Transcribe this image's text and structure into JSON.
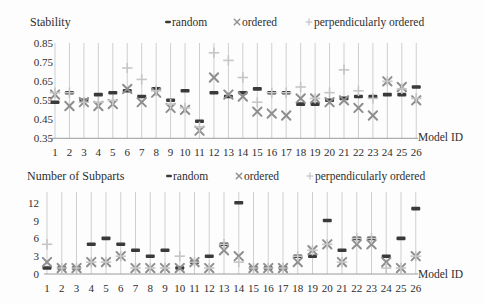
{
  "charts": {
    "stability": {
      "title": "Stability",
      "xlabel": "Model ID",
      "legend": [
        "random",
        "ordered",
        "perpendicularly ordered"
      ]
    },
    "subparts": {
      "title": "Number of Subparts",
      "xlabel": "Model ID",
      "legend": [
        "random",
        "ordered",
        "perpendicularly ordered"
      ]
    }
  },
  "colors": {
    "random": "#3a3a3a",
    "ordered": "#8e8e8e",
    "perpendicular": "#c6c6c6",
    "gridline": "#cfcfcf",
    "axis": "#9a9a9a"
  },
  "chart_data": [
    {
      "type": "scatter",
      "title": "Stability",
      "xlabel": "Model ID",
      "ylabel": "",
      "categories": [
        1,
        2,
        3,
        4,
        5,
        6,
        7,
        8,
        9,
        10,
        11,
        12,
        13,
        14,
        15,
        16,
        17,
        18,
        19,
        20,
        21,
        22,
        23,
        24,
        25,
        26
      ],
      "yticks": [
        "0.85",
        "0.75",
        "0.65",
        "0.55",
        "0.45",
        "0.35"
      ],
      "ylim": [
        0.35,
        0.85
      ],
      "grid": "vertical lines at each category",
      "legend_position": "top",
      "series": [
        {
          "name": "random",
          "marker": "dash",
          "values": [
            0.54,
            0.59,
            0.55,
            0.58,
            0.59,
            0.6,
            0.57,
            0.61,
            0.55,
            0.6,
            0.44,
            0.59,
            0.57,
            0.59,
            0.61,
            0.59,
            0.59,
            0.53,
            0.53,
            0.55,
            0.56,
            0.57,
            0.57,
            0.58,
            0.58,
            0.62
          ]
        },
        {
          "name": "ordered",
          "marker": "x",
          "values": [
            0.58,
            0.52,
            0.54,
            0.52,
            0.53,
            0.61,
            0.54,
            0.59,
            0.51,
            0.5,
            0.39,
            0.67,
            0.58,
            0.57,
            0.49,
            0.48,
            0.47,
            0.56,
            0.56,
            0.54,
            0.55,
            0.51,
            0.47,
            0.65,
            0.62,
            0.55
          ]
        },
        {
          "name": "perpendicularly ordered",
          "marker": "plus",
          "values": [
            0.59,
            0.59,
            0.54,
            0.54,
            0.55,
            0.72,
            0.66,
            0.6,
            0.53,
            0.51,
            0.41,
            0.8,
            0.76,
            0.67,
            0.54,
            0.59,
            0.59,
            0.62,
            0.56,
            0.59,
            0.71,
            0.6,
            0.56,
            0.65,
            0.61,
            0.56
          ]
        }
      ]
    },
    {
      "type": "scatter",
      "title": "Number of Subparts",
      "xlabel": "Model ID",
      "ylabel": "",
      "categories": [
        1,
        2,
        3,
        4,
        5,
        6,
        7,
        8,
        9,
        10,
        11,
        12,
        13,
        14,
        15,
        16,
        17,
        18,
        19,
        20,
        21,
        22,
        23,
        24,
        25,
        26
      ],
      "yticks": [
        "12",
        "9",
        "6",
        "3",
        "0"
      ],
      "ylim": [
        0,
        12
      ],
      "grid": "vertical lines at each category",
      "legend_position": "top",
      "series": [
        {
          "name": "random",
          "marker": "dash",
          "values": [
            1,
            1,
            1,
            5,
            6,
            5,
            4,
            3,
            4,
            1,
            2,
            3,
            5,
            12,
            1,
            1,
            1,
            3,
            3,
            9,
            4,
            6,
            6,
            3,
            6,
            11
          ]
        },
        {
          "name": "ordered",
          "marker": "x",
          "values": [
            2,
            1,
            1,
            2,
            2,
            3,
            1,
            1,
            1,
            1,
            2,
            1,
            4,
            3,
            1,
            1,
            1,
            2,
            4,
            5,
            2,
            5,
            5,
            2,
            1,
            3
          ]
        },
        {
          "name": "perpendicularly ordered",
          "marker": "plus",
          "values": [
            5,
            1,
            1,
            2,
            2,
            3,
            1,
            1,
            1,
            3,
            2,
            1,
            5,
            2,
            1,
            1,
            1,
            3,
            4,
            5,
            2,
            6,
            6,
            1,
            1,
            3
          ]
        }
      ]
    }
  ]
}
